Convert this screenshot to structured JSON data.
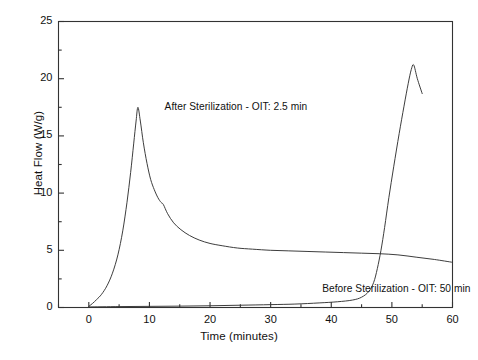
{
  "chart_data": {
    "type": "line",
    "title": "",
    "xlabel": "Time (minutes)",
    "ylabel": "Heat Flow (W/g)",
    "xlim": [
      -5,
      60
    ],
    "ylim": [
      0,
      25
    ],
    "xticks": [
      0,
      10,
      20,
      30,
      40,
      50,
      60
    ],
    "xtick_labels": [
      "0",
      "10",
      "20",
      "30",
      "40",
      "50",
      "60"
    ],
    "x_minor_ticks": [
      -5,
      5,
      15,
      25,
      35,
      45,
      55
    ],
    "yticks": [
      0,
      5,
      10,
      15,
      20,
      25
    ],
    "ytick_labels": [
      "0",
      "5",
      "10",
      "15",
      "20",
      "25"
    ],
    "y_minor_ticks": [
      2.5,
      7.5,
      12.5,
      17.5,
      22.5
    ],
    "grid": false,
    "legend": "annotations-inline",
    "line_color": "#333333",
    "frame_color": "#333333",
    "background": "#ffffff",
    "series": [
      {
        "name": "After Sterilization",
        "annotation": "After Sterilization - OIT: 2.5 min",
        "annotation_x": 12.5,
        "annotation_y": 17.4,
        "oit_minutes": 2.5,
        "x": [
          0,
          0.6,
          1.3,
          2.1,
          3.0,
          3.9,
          4.8,
          5.6,
          6.3,
          6.9,
          7.4,
          7.8,
          8.1,
          8.5,
          9.0,
          9.6,
          10.2,
          10.8,
          11.4,
          11.9,
          12.3,
          13.0,
          14.0,
          15.2,
          16.6,
          18.2,
          20.0,
          22.0,
          24.5,
          27.0,
          30.0,
          33.0,
          36.0,
          39.0,
          42.0,
          45.0,
          48.0,
          51.0,
          54.0,
          57.0,
          60.0
        ],
        "y": [
          0.1,
          0.35,
          0.7,
          1.15,
          1.9,
          3.0,
          4.6,
          6.7,
          9.2,
          11.8,
          14.3,
          16.3,
          17.5,
          16.3,
          14.4,
          12.6,
          11.2,
          10.3,
          9.6,
          9.2,
          9.0,
          8.2,
          7.4,
          6.8,
          6.3,
          5.9,
          5.6,
          5.4,
          5.2,
          5.1,
          5.0,
          4.95,
          4.9,
          4.85,
          4.8,
          4.75,
          4.7,
          4.6,
          4.4,
          4.2,
          3.95
        ]
      },
      {
        "name": "Before Sterilization",
        "annotation": "Before Sterilization - OIT: 50 min",
        "annotation_x": 38.5,
        "annotation_y": 1.55,
        "oit_minutes": 50,
        "x": [
          0,
          5,
          10,
          15,
          20,
          25,
          30,
          34,
          38,
          41,
          43.5,
          45.0,
          46.2,
          47.0,
          47.6,
          48.2,
          48.8,
          49.5,
          50.3,
          51.2,
          52.0,
          52.7,
          53.2,
          53.6,
          54.2,
          55.0
        ],
        "y": [
          0.05,
          0.08,
          0.1,
          0.12,
          0.15,
          0.2,
          0.25,
          0.3,
          0.4,
          0.5,
          0.65,
          0.9,
          1.4,
          2.2,
          3.4,
          5.0,
          7.0,
          9.6,
          12.3,
          15.2,
          17.6,
          19.6,
          20.8,
          21.2,
          20.0,
          18.7
        ]
      }
    ]
  }
}
